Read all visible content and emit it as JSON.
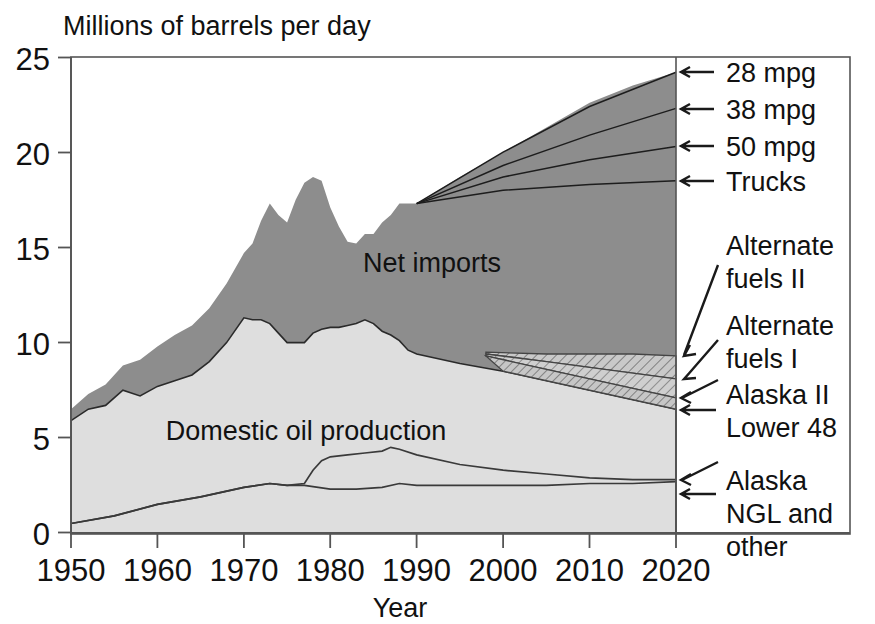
{
  "chart_data": {
    "type": "area",
    "title": "Millions of barrels per day",
    "xlabel": "Year",
    "ylabel": "",
    "xlim": [
      1950,
      2020
    ],
    "ylim": [
      0,
      25
    ],
    "xticks": [
      "1950",
      "1960",
      "1970",
      "1980",
      "1990",
      "2000",
      "2010",
      "2020"
    ],
    "yticks": [
      "0",
      "5",
      "10",
      "15",
      "20",
      "25"
    ],
    "grid": false,
    "legend_position": "right-annotations",
    "area_labels": [
      {
        "text": "Net imports",
        "x": 1983,
        "y": 13.6
      },
      {
        "text": "Domestic oil production",
        "x": 1974,
        "y": 4.9
      }
    ],
    "annotations": [
      {
        "label": "28 mpg",
        "arrow": "left",
        "y": 24.2
      },
      {
        "label": "38 mpg",
        "arrow": "left",
        "y": 22.3
      },
      {
        "label": "50 mpg",
        "arrow": "left",
        "y": 20.3
      },
      {
        "label": "Trucks",
        "arrow": "left",
        "y": 18.5
      },
      {
        "label": "Alternate fuels II",
        "arrow": "diagonal",
        "y": 14.6
      },
      {
        "label": "Alternate fuels I",
        "arrow": "diagonal",
        "y": 11.8
      },
      {
        "label": "Alaska II",
        "arrow": "diagonal",
        "y": 9.4
      },
      {
        "label": "Lower 48",
        "arrow": "left",
        "y": 8.1
      },
      {
        "label": "Alaska",
        "arrow": "diagonal",
        "y": 4.6
      },
      {
        "label": "NGL and other",
        "arrow": "left",
        "y": 3.3
      }
    ],
    "colors": {
      "net_imports_fill": "#8d8d8d",
      "domestic_fill": "#dcdcdc",
      "hatch_fill": "#c4c4c4",
      "line": "#1a1a1a",
      "background": "#ffffff"
    },
    "series": [
      {
        "name": "Total demand (net imports top)",
        "x": [
          1950,
          1952,
          1954,
          1956,
          1958,
          1960,
          1962,
          1964,
          1966,
          1968,
          1970,
          1971,
          1972,
          1973,
          1974,
          1975,
          1976,
          1977,
          1978,
          1979,
          1980,
          1981,
          1982,
          1983,
          1984,
          1985,
          1986,
          1987,
          1988,
          1989,
          1990,
          1995,
          2000,
          2005,
          2010,
          2015,
          2020
        ],
        "values": [
          6.5,
          7.3,
          7.8,
          8.8,
          9.1,
          9.8,
          10.4,
          10.9,
          11.8,
          13.1,
          14.7,
          15.2,
          16.4,
          17.3,
          16.7,
          16.3,
          17.5,
          18.4,
          18.7,
          18.5,
          17.1,
          16.1,
          15.3,
          15.2,
          15.7,
          15.7,
          16.3,
          16.7,
          17.3,
          17.3,
          17.3,
          18.7,
          20.0,
          21.3,
          22.6,
          23.5,
          24.2
        ]
      },
      {
        "name": "Domestic oil production (top of light area)",
        "x": [
          1950,
          1952,
          1954,
          1956,
          1958,
          1960,
          1962,
          1964,
          1966,
          1968,
          1970,
          1971,
          1972,
          1973,
          1974,
          1975,
          1976,
          1977,
          1978,
          1979,
          1980,
          1981,
          1982,
          1983,
          1984,
          1985,
          1986,
          1987,
          1988,
          1989,
          1990,
          1995,
          2000,
          2005,
          2010,
          2015,
          2020
        ],
        "values": [
          5.9,
          6.5,
          6.7,
          7.5,
          7.2,
          7.7,
          8.0,
          8.3,
          9.0,
          10.0,
          11.3,
          11.2,
          11.2,
          11.0,
          10.5,
          10.0,
          10.0,
          10.0,
          10.5,
          10.7,
          10.8,
          10.8,
          10.9,
          11.0,
          11.2,
          11.0,
          10.6,
          10.4,
          10.1,
          9.6,
          9.4,
          8.9,
          8.5,
          8.0,
          7.5,
          7.0,
          6.5
        ]
      },
      {
        "name": "Alaska (upper interior line)",
        "x": [
          1950,
          1955,
          1960,
          1965,
          1970,
          1973,
          1975,
          1977,
          1978,
          1979,
          1980,
          1982,
          1984,
          1986,
          1987,
          1988,
          1990,
          1995,
          2000,
          2005,
          2010,
          2015,
          2020
        ],
        "values": [
          0.5,
          0.9,
          1.5,
          1.9,
          2.4,
          2.6,
          2.5,
          2.6,
          3.3,
          3.8,
          4.0,
          4.1,
          4.2,
          4.3,
          4.5,
          4.4,
          4.1,
          3.6,
          3.3,
          3.1,
          2.9,
          2.8,
          2.8
        ]
      },
      {
        "name": "NGL and other (lower interior line)",
        "x": [
          1950,
          1955,
          1960,
          1965,
          1970,
          1973,
          1975,
          1977,
          1980,
          1983,
          1986,
          1988,
          1990,
          1995,
          2000,
          2005,
          2010,
          2015,
          2020
        ],
        "values": [
          0.5,
          0.9,
          1.5,
          1.9,
          2.4,
          2.6,
          2.5,
          2.5,
          2.3,
          2.3,
          2.4,
          2.6,
          2.5,
          2.5,
          2.5,
          2.5,
          2.6,
          2.6,
          2.7
        ]
      },
      {
        "name": "28 mpg projection line",
        "x": [
          1990,
          2000,
          2010,
          2020
        ],
        "values": [
          17.3,
          20.0,
          22.4,
          24.2
        ]
      },
      {
        "name": "38 mpg projection line",
        "x": [
          1990,
          2000,
          2010,
          2020
        ],
        "values": [
          17.3,
          19.3,
          20.9,
          22.3
        ]
      },
      {
        "name": "50 mpg projection line",
        "x": [
          1990,
          2000,
          2010,
          2020
        ],
        "values": [
          17.3,
          18.7,
          19.6,
          20.3
        ]
      },
      {
        "name": "Trucks projection line",
        "x": [
          1990,
          2000,
          2010,
          2020
        ],
        "values": [
          17.3,
          18.0,
          18.3,
          18.5
        ]
      },
      {
        "name": "Alternate fuels II boundary",
        "x": [
          1998,
          2005,
          2010,
          2015,
          2020
        ],
        "values": [
          9.5,
          9.4,
          9.4,
          9.4,
          9.3
        ]
      },
      {
        "name": "Alternate fuels I boundary",
        "x": [
          1998,
          2005,
          2010,
          2015,
          2020
        ],
        "values": [
          9.4,
          9.0,
          8.7,
          8.4,
          8.1
        ]
      },
      {
        "name": "Alaska II boundary",
        "x": [
          1998,
          2005,
          2010,
          2015,
          2020
        ],
        "values": [
          9.3,
          8.6,
          8.1,
          7.6,
          7.1
        ]
      }
    ]
  }
}
